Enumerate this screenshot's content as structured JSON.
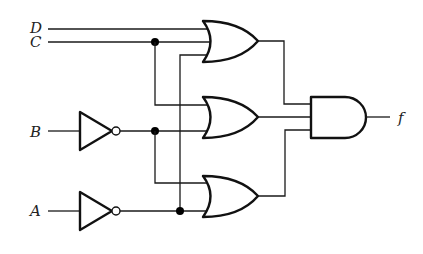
{
  "diagram": {
    "type": "logic-circuit",
    "inputs": [
      {
        "name": "D",
        "label": "D"
      },
      {
        "name": "C",
        "label": "C"
      },
      {
        "name": "B",
        "label": "B"
      },
      {
        "name": "A",
        "label": "A"
      }
    ],
    "output": {
      "name": "f",
      "label": "f"
    },
    "gates": [
      {
        "id": "not-b",
        "type": "NOT",
        "input": "B"
      },
      {
        "id": "not-a",
        "type": "NOT",
        "input": "A"
      },
      {
        "id": "or-1",
        "type": "OR",
        "inputs": [
          "D",
          "C",
          "A'"
        ]
      },
      {
        "id": "or-2",
        "type": "OR",
        "inputs": [
          "C",
          "B'"
        ]
      },
      {
        "id": "or-3",
        "type": "OR",
        "inputs": [
          "B'",
          "A'"
        ]
      },
      {
        "id": "and-1",
        "type": "AND",
        "inputs": [
          "or-1",
          "or-2",
          "or-3"
        ],
        "output": "f"
      }
    ],
    "expression": "f = (D + C + A')(C + B')(B' + A')",
    "colors": {
      "stroke": "#111111",
      "background": "#ffffff"
    }
  }
}
